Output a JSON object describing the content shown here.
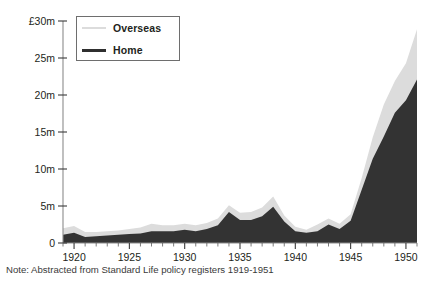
{
  "note": "Note: Abstracted from Standard Life policy registers 1919-1951",
  "legend": {
    "overseas_label": "Overseas",
    "home_label": "Home"
  },
  "axis": {
    "y_ticks": [
      "£30m",
      "25m",
      "20m",
      "15m",
      "10m",
      "5m",
      "0"
    ],
    "x_ticks": [
      "1920",
      "1925",
      "1930",
      "1935",
      "1940",
      "1945",
      "1950"
    ]
  },
  "colors": {
    "home_fill": "#333333",
    "overseas_fill": "#dcdcdc",
    "axis": "#8b8b8b",
    "text": "#231f20",
    "background": "#ffffff"
  },
  "chart_data": {
    "type": "area",
    "stacked": true,
    "title": "",
    "subtitle": "",
    "xlabel": "",
    "ylabel": "",
    "annotations": [
      "Note: Abstracted from Standard Life policy registers 1919-1951"
    ],
    "legend_position": "top-left",
    "grid": false,
    "units": "£ million",
    "xlim": [
      1919,
      1951
    ],
    "ylim": [
      0,
      30
    ],
    "y_tick_values": [
      0,
      5,
      10,
      15,
      20,
      25,
      30
    ],
    "y_tick_labels": [
      "0",
      "5m",
      "10m",
      "15m",
      "20m",
      "25m",
      "£30m"
    ],
    "x_tick_values": [
      1920,
      1925,
      1930,
      1935,
      1940,
      1945,
      1950
    ],
    "x_tick_labels": [
      "1920",
      "1925",
      "1930",
      "1935",
      "1940",
      "1945",
      "1950"
    ],
    "x": [
      1919,
      1920,
      1921,
      1922,
      1923,
      1924,
      1925,
      1926,
      1927,
      1928,
      1929,
      1930,
      1931,
      1932,
      1933,
      1934,
      1935,
      1936,
      1937,
      1938,
      1939,
      1940,
      1941,
      1942,
      1943,
      1944,
      1945,
      1946,
      1947,
      1948,
      1949,
      1950,
      1951
    ],
    "series": [
      {
        "name": "Home",
        "color": "#333333",
        "values": [
          1.1,
          1.4,
          0.8,
          0.9,
          1.0,
          1.1,
          1.2,
          1.3,
          1.6,
          1.6,
          1.6,
          1.8,
          1.6,
          1.9,
          2.4,
          4.2,
          3.1,
          3.1,
          3.6,
          4.9,
          2.9,
          1.6,
          1.4,
          1.6,
          2.5,
          1.9,
          3.0,
          7.2,
          11.4,
          14.4,
          17.6,
          19.3,
          22.1
        ]
      },
      {
        "name": "Overseas",
        "color": "#dcdcdc",
        "values": [
          0.9,
          0.9,
          0.7,
          0.6,
          0.6,
          0.6,
          0.7,
          0.8,
          1.0,
          0.8,
          0.8,
          0.8,
          0.8,
          0.8,
          0.9,
          0.9,
          1.0,
          1.1,
          1.2,
          1.4,
          0.8,
          0.6,
          0.4,
          0.9,
          0.8,
          0.7,
          0.9,
          1.6,
          2.9,
          4.3,
          4.3,
          5.0,
          6.8
        ]
      }
    ],
    "totals": [
      2.0,
      2.3,
      1.5,
      1.5,
      1.6,
      1.7,
      1.9,
      2.1,
      2.6,
      2.4,
      2.4,
      2.6,
      2.4,
      2.7,
      3.3,
      5.1,
      4.1,
      4.2,
      4.8,
      6.3,
      3.7,
      2.2,
      1.8,
      2.5,
      3.3,
      2.6,
      3.9,
      8.8,
      14.3,
      18.7,
      21.9,
      24.3,
      28.9
    ]
  }
}
